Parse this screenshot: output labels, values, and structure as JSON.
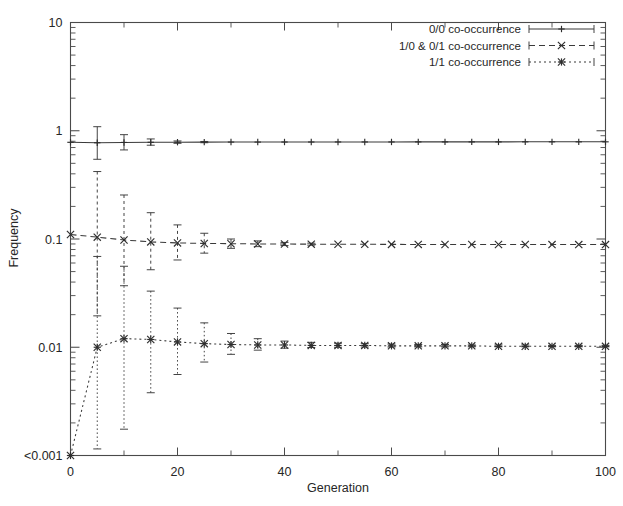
{
  "figure": {
    "background": "#ffffff",
    "foreground": "#2e2e2e"
  },
  "axes": {
    "x_title": "Generation",
    "y_title": "Frequency",
    "x_tick_labels": [
      "0",
      "20",
      "40",
      "60",
      "80",
      "100"
    ],
    "y_tick_labels": [
      "<0.001",
      "0.01",
      "0.1",
      "1",
      "10"
    ]
  },
  "legend": {
    "entries": [
      {
        "label": "0/0 co-occurrence",
        "style": "solid",
        "marker": "plus"
      },
      {
        "label": "1/0 & 0/1 co-occurrence",
        "style": "dashed",
        "marker": "cross"
      },
      {
        "label": "1/1 co-occurrence",
        "style": "dotted",
        "marker": "star"
      }
    ]
  },
  "chart_data": {
    "type": "line",
    "title": "",
    "xlabel": "Generation",
    "ylabel": "Frequency",
    "xlim": [
      0,
      100
    ],
    "ylim": [
      0.001,
      10
    ],
    "yscale": "log",
    "y_tick_values": [
      0.001,
      0.01,
      0.1,
      1,
      10
    ],
    "y_tick_labels": [
      "<0.001",
      "0.01",
      "0.1",
      "1",
      "10"
    ],
    "x_tick_values": [
      0,
      20,
      40,
      60,
      80,
      100
    ],
    "x_minor_tick_values": [
      10,
      30,
      50,
      70,
      90
    ],
    "grid": false,
    "legend_position": "top-right",
    "x": [
      0,
      5,
      10,
      15,
      20,
      25,
      30,
      35,
      40,
      45,
      50,
      55,
      60,
      65,
      70,
      75,
      80,
      85,
      90,
      95,
      100
    ],
    "series": [
      {
        "name": "0/0 co-occurrence",
        "linestyle": "solid",
        "marker": "plus",
        "values": [
          0.782,
          0.775,
          0.78,
          0.782,
          0.784,
          0.785,
          0.786,
          0.786,
          0.787,
          0.787,
          0.788,
          0.788,
          0.788,
          0.789,
          0.789,
          0.789,
          0.789,
          0.79,
          0.79,
          0.79,
          0.79
        ],
        "err_low": [
          0.782,
          0.545,
          0.665,
          0.735,
          0.765,
          0.775,
          0.78,
          0.782,
          0.784,
          0.785,
          0.786,
          0.786,
          0.787,
          0.787,
          0.788,
          0.788,
          0.788,
          0.789,
          0.789,
          0.789,
          0.789
        ],
        "err_high": [
          0.782,
          1.09,
          0.92,
          0.84,
          0.805,
          0.796,
          0.792,
          0.79,
          0.79,
          0.789,
          0.79,
          0.79,
          0.79,
          0.791,
          0.791,
          0.791,
          0.791,
          0.791,
          0.791,
          0.791,
          0.791
        ]
      },
      {
        "name": "1/0 & 0/1 co-occurrence",
        "linestyle": "dashed",
        "marker": "cross",
        "values": [
          0.11,
          0.104,
          0.098,
          0.094,
          0.092,
          0.091,
          0.0905,
          0.09,
          0.0898,
          0.0896,
          0.0894,
          0.0893,
          0.0892,
          0.0891,
          0.089,
          0.089,
          0.0889,
          0.0889,
          0.0888,
          0.0888,
          0.0888
        ],
        "err_low": [
          0.11,
          0.0195,
          0.037,
          0.052,
          0.064,
          0.074,
          0.082,
          0.085,
          0.087,
          0.0878,
          0.0884,
          0.0886,
          0.0887,
          0.0887,
          0.0888,
          0.0888,
          0.0888,
          0.0888,
          0.0887,
          0.0887,
          0.0887
        ],
        "err_high": [
          0.11,
          0.42,
          0.255,
          0.175,
          0.135,
          0.113,
          0.1,
          0.096,
          0.093,
          0.0915,
          0.0905,
          0.09,
          0.0897,
          0.0895,
          0.0893,
          0.0892,
          0.0891,
          0.089,
          0.089,
          0.0889,
          0.0889
        ]
      },
      {
        "name": "1/1 co-occurrence",
        "linestyle": "dotted",
        "marker": "star",
        "values": [
          0.001,
          0.01,
          0.012,
          0.0118,
          0.0112,
          0.0108,
          0.0106,
          0.0105,
          0.0105,
          0.0104,
          0.0104,
          0.0104,
          0.0103,
          0.0103,
          0.0103,
          0.0103,
          0.0102,
          0.0102,
          0.0102,
          0.0102,
          0.0102
        ],
        "err_low": [
          0.001,
          0.00115,
          0.00175,
          0.0038,
          0.0056,
          0.0073,
          0.0086,
          0.0094,
          0.0098,
          0.00995,
          0.01,
          0.01005,
          0.01005,
          0.01008,
          0.01008,
          0.0101,
          0.0101,
          0.0101,
          0.0101,
          0.0101,
          0.0101
        ],
        "err_high": [
          0.001,
          0.069,
          0.056,
          0.033,
          0.023,
          0.0168,
          0.0134,
          0.012,
          0.0114,
          0.0111,
          0.0109,
          0.0108,
          0.0107,
          0.0106,
          0.0106,
          0.0105,
          0.0105,
          0.0105,
          0.0104,
          0.0104,
          0.0104
        ]
      }
    ]
  }
}
